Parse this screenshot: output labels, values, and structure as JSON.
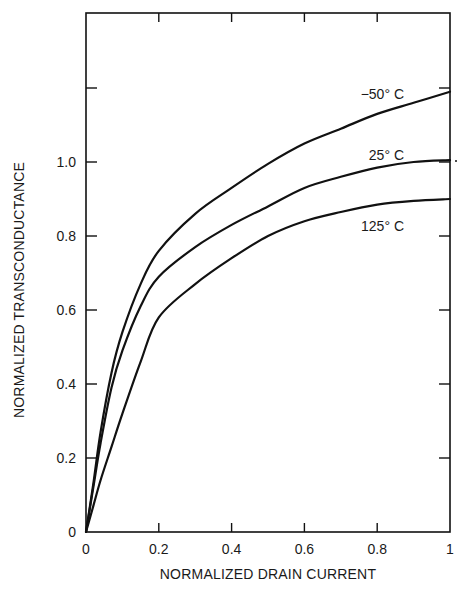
{
  "chart_data": {
    "type": "line",
    "title": "",
    "xlabel": "NORMALIZED DRAIN CURRENT",
    "ylabel": "NORMALIZED TRANSCONDUCTANCE",
    "xlim": [
      0,
      1
    ],
    "ylim": [
      0,
      1.4
    ],
    "x_ticks": [
      0,
      0.2,
      0.4,
      0.6,
      0.8,
      1
    ],
    "x_tick_labels": [
      "0",
      "0.2",
      "0.4",
      "0.6",
      "0.8",
      "1"
    ],
    "y_ticks": [
      0,
      0.2,
      0.4,
      0.6,
      0.8,
      1.0,
      1.2
    ],
    "y_tick_labels": [
      "0",
      "0.2",
      "0.4",
      "0.6",
      "0.8",
      "1.0",
      ""
    ],
    "grid": false,
    "legend": "inline labels near right end of curves",
    "x": [
      0,
      0.02,
      0.04,
      0.07,
      0.1,
      0.15,
      0.2,
      0.3,
      0.4,
      0.5,
      0.6,
      0.7,
      0.8,
      0.9,
      1.0
    ],
    "series": [
      {
        "name": "-50°C",
        "label": "−50° C",
        "values": [
          0,
          0.13,
          0.27,
          0.43,
          0.54,
          0.67,
          0.76,
          0.86,
          0.93,
          0.995,
          1.05,
          1.09,
          1.13,
          1.16,
          1.19
        ]
      },
      {
        "name": "25°C",
        "label": "25° C",
        "values": [
          0,
          0.12,
          0.24,
          0.39,
          0.49,
          0.61,
          0.69,
          0.77,
          0.83,
          0.88,
          0.93,
          0.96,
          0.985,
          1.0,
          1.005
        ]
      },
      {
        "name": "125°C",
        "label": "125° C",
        "values": [
          0,
          0.07,
          0.14,
          0.23,
          0.32,
          0.46,
          0.58,
          0.67,
          0.74,
          0.8,
          0.84,
          0.865,
          0.885,
          0.895,
          0.9
        ]
      }
    ]
  },
  "axes": {
    "xlabel": "NORMALIZED DRAIN CURRENT",
    "ylabel": "NORMALIZED TRANSCONDUCTANCE"
  },
  "colors": {
    "line": "#111111",
    "background": "#ffffff"
  }
}
